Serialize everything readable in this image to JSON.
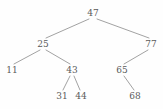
{
  "figure": {
    "type": "binary-search-tree-diagram",
    "background_color": "#fefefe",
    "edge_color": "#8a8a8a",
    "label_color": "#5a5a5a",
    "width": 163,
    "height": 109
  },
  "chart_data": {
    "type": "diagram",
    "title": "",
    "nodes": [
      {
        "id": "n47",
        "label": "47",
        "x": 93,
        "y": 13,
        "depth": 0,
        "parent": null
      },
      {
        "id": "n25",
        "label": "25",
        "x": 43,
        "y": 44,
        "depth": 1,
        "parent": "n47",
        "side": "left"
      },
      {
        "id": "n77",
        "label": "77",
        "x": 151,
        "y": 44,
        "depth": 1,
        "parent": "n47",
        "side": "right"
      },
      {
        "id": "n11",
        "label": "11",
        "x": 12,
        "y": 70,
        "depth": 2,
        "parent": "n25",
        "side": "left"
      },
      {
        "id": "n43",
        "label": "43",
        "x": 72,
        "y": 70,
        "depth": 2,
        "parent": "n25",
        "side": "right"
      },
      {
        "id": "n65",
        "label": "65",
        "x": 122,
        "y": 70,
        "depth": 2,
        "parent": "n77",
        "side": "left"
      },
      {
        "id": "n31",
        "label": "31",
        "x": 62,
        "y": 96,
        "depth": 3,
        "parent": "n43",
        "side": "left"
      },
      {
        "id": "n44",
        "label": "44",
        "x": 81,
        "y": 96,
        "depth": 3,
        "parent": "n43",
        "side": "right"
      },
      {
        "id": "n68",
        "label": "68",
        "x": 135,
        "y": 96,
        "depth": 3,
        "parent": "n65",
        "side": "right"
      }
    ],
    "edges": [
      {
        "from": "n47",
        "to": "n25",
        "x1": 89,
        "y1": 19,
        "x2": 46,
        "y2": 38
      },
      {
        "from": "n47",
        "to": "n77",
        "x1": 97,
        "y1": 19,
        "x2": 149,
        "y2": 38
      },
      {
        "from": "n25",
        "to": "n11",
        "x1": 40,
        "y1": 50,
        "x2": 14,
        "y2": 64
      },
      {
        "from": "n25",
        "to": "n43",
        "x1": 46,
        "y1": 50,
        "x2": 70,
        "y2": 64
      },
      {
        "from": "n77",
        "to": "n65",
        "x1": 148,
        "y1": 50,
        "x2": 124,
        "y2": 64
      },
      {
        "from": "n43",
        "to": "n31",
        "x1": 70,
        "y1": 76,
        "x2": 63,
        "y2": 90
      },
      {
        "from": "n43",
        "to": "n44",
        "x1": 74,
        "y1": 76,
        "x2": 80,
        "y2": 90
      },
      {
        "from": "n65",
        "to": "n68",
        "x1": 124,
        "y1": 76,
        "x2": 134,
        "y2": 90
      }
    ]
  }
}
